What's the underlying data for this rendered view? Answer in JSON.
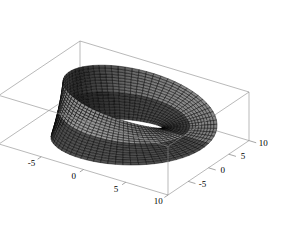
{
  "figure": {
    "background_color": "#ffffff",
    "box_edge_color": "#8a8a8a",
    "mesh_line_color": "#000000",
    "surface_light_color": "#b4b4b4",
    "surface_dark_color": "#1a1a1a",
    "width": 306,
    "height": 242
  },
  "chart_data": {
    "type": "surface3d",
    "title": "",
    "subtitle": "",
    "xlabel": "",
    "ylabel": "",
    "zlabel": "",
    "grid": false,
    "legend": "none",
    "projection": {
      "kind": "axonometric",
      "view_point": [
        1.3,
        -2.4,
        2.0
      ]
    },
    "axes": [
      {
        "name": "x-axis",
        "position": "front-bottom-left-to-right",
        "range": [
          -10,
          10
        ],
        "ticks": [
          -10,
          -5,
          0,
          5,
          10
        ],
        "tick_labels": [
          "-10",
          "-5",
          "0",
          "5",
          "10"
        ]
      },
      {
        "name": "y-axis",
        "position": "right-bottom-front-to-back",
        "range": [
          -10,
          10
        ],
        "ticks": [
          -10,
          -5,
          0,
          5,
          10
        ],
        "tick_labels": [
          "-10",
          "-5",
          "0",
          "5",
          "10"
        ],
        "visible_tick_labels": [
          "-5",
          "0",
          "5",
          "10"
        ]
      },
      {
        "name": "z-axis",
        "position": "left-vertical",
        "range": [
          -3,
          3
        ],
        "ticks": [
          -2,
          0,
          2
        ],
        "tick_labels": [
          "-2",
          "0",
          "2"
        ]
      }
    ],
    "surface": {
      "kind": "parametric",
      "u_range": [
        0,
        6.283185307179586
      ],
      "v_range": [
        -1,
        1
      ],
      "u_samples": 72,
      "v_samples": 18,
      "major_radius": 7.0,
      "band_half_width": 3.0,
      "twists": 1,
      "x_expr": "(R + w*v*cos(u/2))*cos(u)",
      "y_expr": "(R + w*v*cos(u/2))*sin(u)",
      "z_expr": "w*v*sin(u/2)",
      "shading": "lambertian-grayscale",
      "mesh_visible": true
    }
  }
}
